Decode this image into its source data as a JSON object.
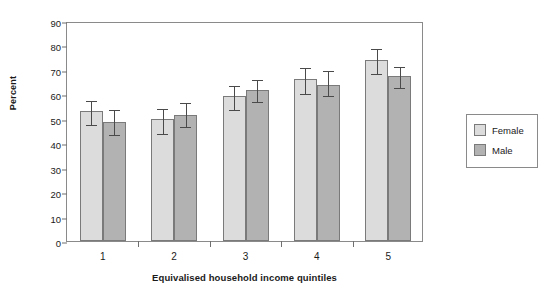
{
  "chart_data": {
    "type": "bar",
    "title": "",
    "subtitle": "",
    "xlabel": "Equivalised household income quintiles",
    "ylabel": "Percent",
    "categories": [
      "1",
      "2",
      "3",
      "4",
      "5"
    ],
    "ylim": [
      0,
      90
    ],
    "yticks": [
      0,
      10,
      20,
      30,
      40,
      50,
      60,
      70,
      80,
      90
    ],
    "ytick_labels": [
      "0",
      "10",
      "20",
      "30",
      "40",
      "50",
      "60",
      "70",
      "80",
      "90"
    ],
    "grid": false,
    "legend_position": "right",
    "series": [
      {
        "name": "Female",
        "color": "#dcdcdc",
        "values": [
          53.0,
          49.8,
          59.3,
          66.4,
          74.0
        ],
        "err_low": [
          48.3,
          44.7,
          54.3,
          61.0,
          69.2
        ],
        "err_high": [
          58.1,
          54.8,
          64.2,
          71.7,
          79.5
        ]
      },
      {
        "name": "Male",
        "color": "#b2b2b2",
        "values": [
          48.5,
          51.4,
          61.8,
          64.0,
          67.5
        ],
        "err_low": [
          44.2,
          47.5,
          57.7,
          60.1,
          63.4
        ],
        "err_high": [
          54.6,
          57.4,
          66.8,
          70.4,
          72.0
        ]
      }
    ]
  },
  "legend": {
    "items": [
      {
        "label": "Female",
        "swatch": "female"
      },
      {
        "label": "Male",
        "swatch": "male"
      }
    ]
  },
  "colors": {
    "female_bar": "#dcdcdc",
    "male_bar": "#b2b2b2",
    "bar_outline": "#7a7a7a",
    "axis": "#8a8a8a",
    "error_bar": "#4a4a4a",
    "text": "#1a1a1a",
    "background": "#ffffff"
  }
}
